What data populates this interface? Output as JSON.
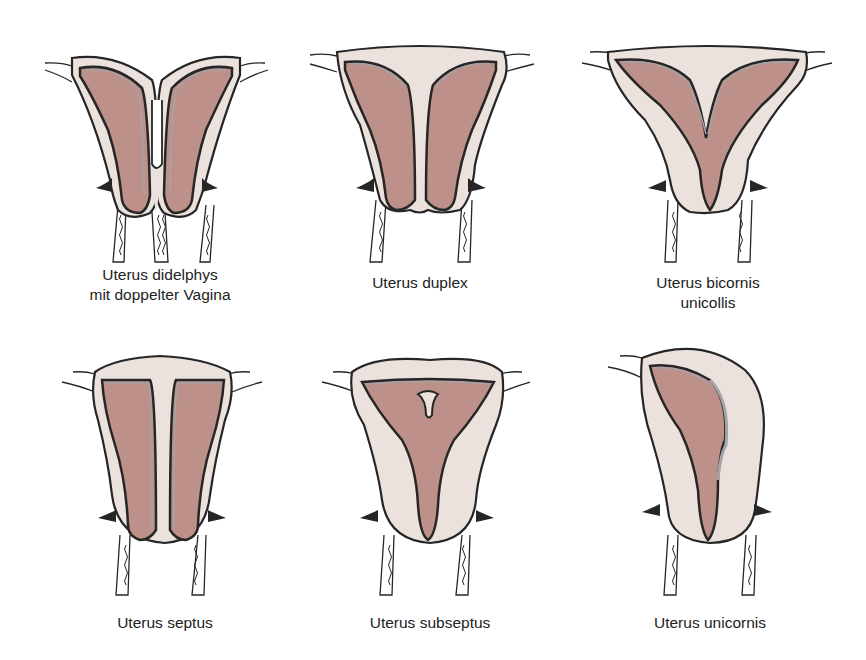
{
  "figure": {
    "colors": {
      "tissue": "#ebe2dd",
      "cavity": "#bd9189",
      "lining": "#a4a4a8",
      "outline": "#262626",
      "background": "#ffffff"
    },
    "panels": [
      {
        "id": "didelphys",
        "caption": "Uterus didelphys\nmit doppelter Vagina"
      },
      {
        "id": "duplex",
        "caption": "Uterus duplex"
      },
      {
        "id": "bicornis",
        "caption": "Uterus bicornis\nunicollis"
      },
      {
        "id": "septus",
        "caption": "Uterus septus"
      },
      {
        "id": "subseptus",
        "caption": "Uterus subseptus"
      },
      {
        "id": "unicornis",
        "caption": "Uterus unicornis"
      }
    ]
  }
}
